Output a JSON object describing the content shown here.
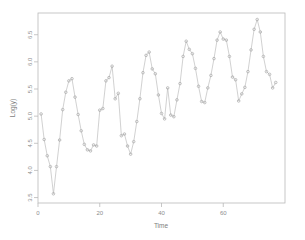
{
  "chart": {
    "type_label": "scatter-line-plot",
    "background": "#ffffff",
    "frame_color": "#b9b9b9",
    "series_color": "#b0b0b0"
  },
  "axes": {
    "x_title": "Time",
    "y_title": "Log(y)",
    "x_ticks": [
      "0",
      "20",
      "40",
      "60"
    ],
    "y_ticks": [
      "3.5",
      "4.0",
      "4.5",
      "5.0",
      "5.5",
      "6.0",
      "6.5"
    ]
  },
  "chart_data": {
    "type": "line",
    "title": "",
    "subtitle": "",
    "xlabel": "Time",
    "ylabel": "Log(y)",
    "xlim": [
      0,
      80
    ],
    "ylim": [
      3.4,
      6.9
    ],
    "xticks": [
      0,
      20,
      40,
      60
    ],
    "yticks": [
      3.5,
      4.0,
      4.5,
      5.0,
      5.5,
      6.0,
      6.5
    ],
    "grid": false,
    "legend": "none",
    "markers": "open-circle",
    "line_style": "solid-thin",
    "n_points": 77,
    "x": [
      1,
      2,
      3,
      4,
      5,
      6,
      7,
      8,
      9,
      10,
      11,
      12,
      13,
      14,
      15,
      16,
      17,
      18,
      19,
      20,
      21,
      22,
      23,
      24,
      25,
      26,
      27,
      28,
      29,
      30,
      31,
      32,
      33,
      34,
      35,
      36,
      37,
      38,
      39,
      40,
      41,
      42,
      43,
      44,
      45,
      46,
      47,
      48,
      49,
      50,
      51,
      52,
      53,
      54,
      55,
      56,
      57,
      58,
      59,
      60,
      61,
      62,
      63,
      64,
      65,
      66,
      67,
      68,
      69,
      70,
      71,
      72,
      73,
      74,
      75,
      76,
      77
    ],
    "y": [
      5.04,
      4.57,
      4.27,
      4.07,
      3.57,
      4.07,
      4.56,
      5.12,
      5.44,
      5.65,
      5.69,
      5.35,
      5.03,
      4.73,
      4.48,
      4.38,
      4.36,
      4.47,
      4.45,
      5.11,
      5.14,
      5.65,
      5.71,
      5.92,
      5.32,
      5.42,
      4.64,
      4.67,
      4.45,
      4.3,
      4.53,
      4.9,
      5.32,
      5.8,
      6.12,
      6.18,
      5.87,
      5.78,
      5.39,
      5.05,
      4.95,
      5.52,
      5.02,
      4.99,
      5.3,
      5.6,
      6.1,
      6.38,
      6.23,
      6.15,
      5.88,
      5.55,
      5.27,
      5.25,
      5.52,
      5.75,
      6.06,
      6.4,
      6.55,
      6.42,
      6.4,
      6.1,
      5.72,
      5.67,
      5.28,
      5.41,
      5.53,
      5.82,
      6.22,
      6.6,
      6.78,
      6.55,
      6.1,
      5.82,
      5.77,
      5.52,
      5.62
    ]
  }
}
